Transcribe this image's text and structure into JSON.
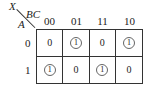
{
  "kmap": {
    "output_var": "X",
    "col_vars": "BC",
    "row_var": "A",
    "columns": [
      "00",
      "01",
      "11",
      "10"
    ],
    "rows": [
      "0",
      "1"
    ],
    "cells": [
      [
        {
          "value": "0",
          "circled": false
        },
        {
          "value": "1",
          "circled": true
        },
        {
          "value": "0",
          "circled": false
        },
        {
          "value": "1",
          "circled": true
        }
      ],
      [
        {
          "value": "1",
          "circled": true
        },
        {
          "value": "0",
          "circled": false
        },
        {
          "value": "1",
          "circled": true
        },
        {
          "value": "0",
          "circled": false
        }
      ]
    ]
  }
}
